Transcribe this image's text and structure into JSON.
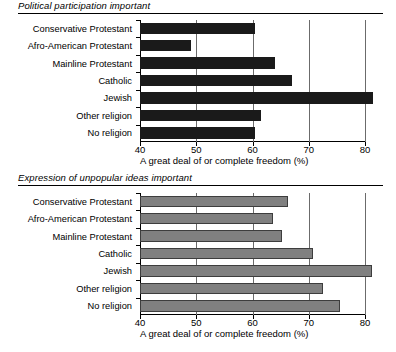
{
  "chart_data": [
    {
      "type": "bar",
      "orientation": "horizontal",
      "title": "Political participation important",
      "xlabel": "A great deal of or complete freedom (%)",
      "ylabel": "",
      "xlim": [
        40,
        80
      ],
      "xticks": [
        40,
        50,
        60,
        70,
        80
      ],
      "gridlines": [
        50,
        60,
        70,
        80
      ],
      "grid": true,
      "legend": "none",
      "bar_color": "#1a1a1a",
      "categories": [
        "Conservative Protestant",
        "Afro-American Protestant",
        "Mainline Protestant",
        "Catholic",
        "Jewish",
        "Other religion",
        "No religion"
      ],
      "values": [
        60.5,
        49.0,
        64.0,
        67.0,
        81.5,
        61.5,
        60.5
      ]
    },
    {
      "type": "bar",
      "orientation": "horizontal",
      "title": "Expression of  unpopular ideas important",
      "xlabel": "A great deal of or complete freedom (%)",
      "ylabel": "",
      "xlim": [
        40,
        80
      ],
      "xticks": [
        40,
        50,
        60,
        70,
        80
      ],
      "gridlines": [
        50,
        60,
        70,
        80
      ],
      "grid": true,
      "legend": "none",
      "bar_color": "#808080",
      "categories": [
        "Conservative Protestant",
        "Afro-American Protestant",
        "Mainline Protestant",
        "Catholic",
        "Jewish",
        "Other religion",
        "No religion"
      ],
      "values": [
        66.3,
        63.7,
        65.3,
        70.8,
        81.3,
        72.6,
        75.6
      ]
    }
  ],
  "panels": [
    {
      "title": "Political participation important",
      "xlabel": "A great deal of or complete freedom (%)",
      "ticklabels": [
        "40",
        "50",
        "60",
        "70",
        "80"
      ]
    },
    {
      "title": "Expression of  unpopular ideas important",
      "xlabel": "A great deal of or complete freedom (%)",
      "ticklabels": [
        "40",
        "50",
        "60",
        "70",
        "80"
      ]
    }
  ]
}
